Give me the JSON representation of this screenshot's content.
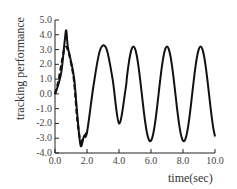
{
  "chart_data": {
    "type": "line",
    "title": "",
    "xlabel": "time(sec)",
    "ylabel": "tracking performance",
    "xlim": [
      0,
      10
    ],
    "ylim": [
      -4,
      5
    ],
    "x_ticks": [
      "0.0",
      "2.0",
      "4.0",
      "6.0",
      "8.0",
      "10.0"
    ],
    "y_ticks": [
      "5.0",
      "4.0",
      "3.0",
      "2.0",
      "1.0",
      "0.0",
      "-1.0",
      "-2.0",
      "-3.0",
      "-4.0"
    ],
    "grid": false,
    "legend": null,
    "series": [
      {
        "name": "actual (solid)",
        "style": "solid",
        "x": [
          0.0,
          0.2,
          0.4,
          0.6,
          0.7,
          0.8,
          1.0,
          1.2,
          1.4,
          1.6,
          1.8,
          2.0,
          2.4,
          2.8,
          3.2,
          3.6,
          4.0,
          4.4,
          4.9,
          5.4,
          5.9,
          6.4,
          7.0,
          7.5,
          8.0,
          8.5,
          9.1,
          9.6,
          10.0
        ],
        "y": [
          0.0,
          0.6,
          1.5,
          3.5,
          4.3,
          3.2,
          2.2,
          1.0,
          -1.5,
          -3.5,
          -2.9,
          -2.6,
          0.5,
          2.9,
          3.1,
          1.0,
          -2.0,
          -3.2,
          3.2,
          -1.5,
          -3.2,
          0.0,
          3.2,
          0.0,
          -3.2,
          0.0,
          3.2,
          0.0,
          -2.8
        ]
      },
      {
        "name": "desired (dashed)",
        "style": "dashed",
        "x": [
          0.0,
          0.2,
          0.4,
          0.6,
          0.8,
          1.0,
          1.2,
          1.4,
          1.6,
          1.8,
          2.0
        ],
        "y": [
          0.0,
          0.8,
          2.0,
          3.1,
          3.0,
          2.1,
          0.8,
          -1.8,
          -3.2,
          -2.9,
          -2.6
        ]
      }
    ]
  }
}
